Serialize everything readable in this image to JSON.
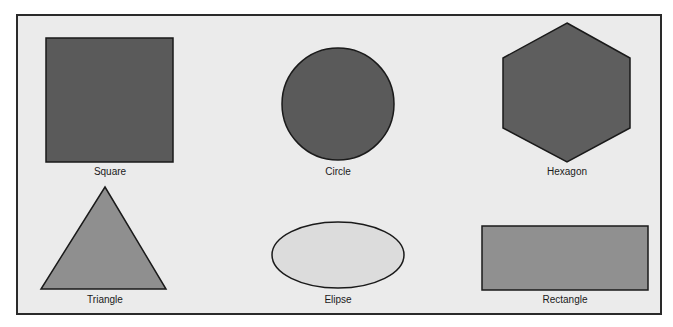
{
  "figure": {
    "background_color": "#ebebeb",
    "border_color": "#2a2a2a"
  },
  "shapes": [
    {
      "id": "square",
      "label": "Square",
      "fill": "#5a5a5a"
    },
    {
      "id": "circle",
      "label": "Circle",
      "fill": "#5a5a5a"
    },
    {
      "id": "hexagon",
      "label": "Hexagon",
      "fill": "#5e5e5e"
    },
    {
      "id": "triangle",
      "label": "Triangle",
      "fill": "#8f8f8f"
    },
    {
      "id": "ellipse",
      "label": "Elipse",
      "fill": "#dcdcdc"
    },
    {
      "id": "rectangle",
      "label": "Rectangle",
      "fill": "#909090"
    }
  ]
}
